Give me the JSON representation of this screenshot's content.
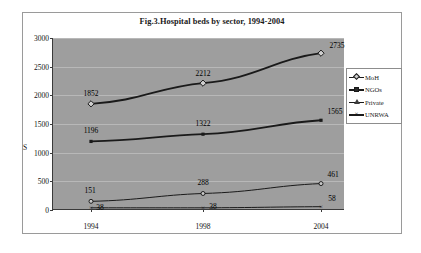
{
  "chart_data": {
    "type": "line",
    "title": "Fig.3.Hospital beds by sector, 1994-2004",
    "xlabel": "",
    "ylabel": "S",
    "categories": [
      "1994",
      "1998",
      "2004"
    ],
    "x": [
      1994,
      1998,
      2004
    ],
    "ylim": [
      0,
      3000
    ],
    "yticks": [
      0,
      500,
      1000,
      1500,
      2000,
      2500,
      3000
    ],
    "ytick_labels": [
      "0",
      "500",
      "1000",
      "1500",
      "2000",
      "2500",
      "3000"
    ],
    "grid": true,
    "legend_position": "right",
    "plot_background": "#9e9e9e",
    "series": [
      {
        "name": "MoH",
        "marker": "diamond",
        "color": "#1a1a1a",
        "values": [
          1852,
          2212,
          2735
        ],
        "labels": [
          "1852",
          "2212",
          "2735"
        ]
      },
      {
        "name": "NGOs",
        "marker": "square",
        "color": "#1a1a1a",
        "values": [
          1196,
          1322,
          1565
        ],
        "labels": [
          "1196",
          "1322",
          "1565"
        ]
      },
      {
        "name": "Private",
        "marker": "triangle",
        "color": "#1a1a1a",
        "values": [
          151,
          288,
          461
        ],
        "labels": [
          "151",
          "288",
          "461"
        ]
      },
      {
        "name": "UNRWA",
        "marker": "cross",
        "color": "#1a1a1a",
        "values": [
          38,
          38,
          58
        ],
        "labels": [
          "38",
          "38",
          "58"
        ]
      }
    ]
  },
  "legend": {
    "items": [
      {
        "label": "MoH"
      },
      {
        "label": "NGOs"
      },
      {
        "label": "Private"
      },
      {
        "label": "UNRWA"
      }
    ]
  }
}
